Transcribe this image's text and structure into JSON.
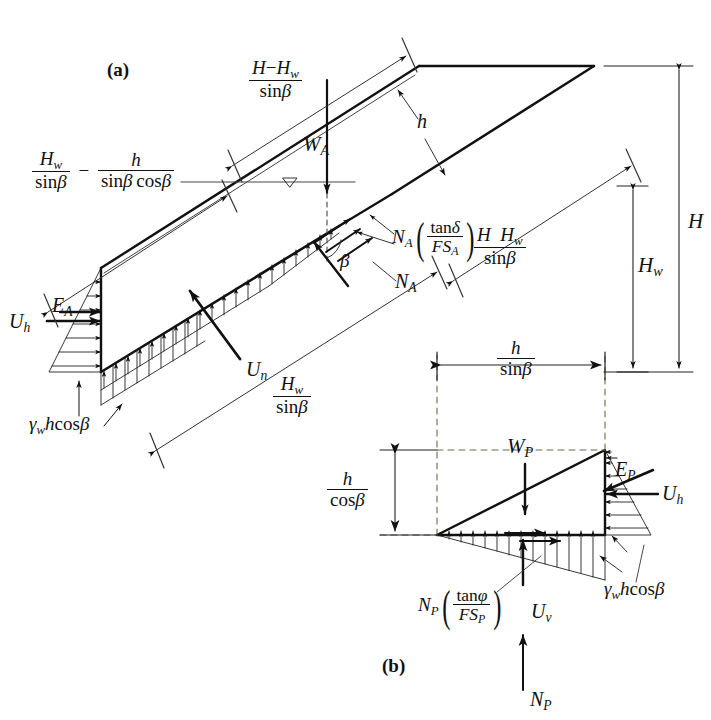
{
  "figure": {
    "title_tags": {
      "a": "(a)",
      "b": "(b)"
    },
    "panel_a": {
      "name": "active-wedge-diagram",
      "dimension_labels": [
        {
          "id": "H-minus-Hw-over-sinbeta",
          "num_parts": [
            "H",
            "−",
            "H",
            "w"
          ],
          "den_parts": [
            "sin",
            "β"
          ]
        },
        {
          "id": "Hw-over-sinbeta-minus-h-over-sinbeta-cosbeta"
        },
        {
          "id": "H-minus-Hw-over-sinbeta-right"
        },
        {
          "id": "Hw-over-sinbeta-bottom"
        },
        {
          "id": "H-total"
        },
        {
          "id": "Hw-total"
        }
      ],
      "force_labels": {
        "W_A": "W",
        "W_A_sub": "A",
        "N_A": "N",
        "N_A_sub": "A",
        "U_n": "U",
        "U_n_sub": "n",
        "U_h": "U",
        "U_h_sub": "h",
        "E_A": "E",
        "E_A_sub": "A",
        "h": "h",
        "beta": "β",
        "gamma_w_h_cos_beta": "γwhcosβ",
        "N_A_tan_delta_over_FS_A": "N_A(tanδ/FS_A)"
      },
      "text": {
        "H": "H",
        "Hw": "Hw",
        "h": "h",
        "beta": "β",
        "delta": "δ",
        "sin": "sin",
        "cos": "cos",
        "tan": "tan",
        "FS": "FS",
        "minus": "−",
        "gamma": "γ"
      }
    },
    "panel_b": {
      "name": "passive-wedge-diagram",
      "dimension_labels": [
        {
          "id": "h-over-sinbeta"
        },
        {
          "id": "h-over-cosbeta"
        }
      ],
      "force_labels": {
        "W_P": "W",
        "W_P_sub": "P",
        "N_P": "N",
        "N_P_sub": "P",
        "U_v": "U",
        "U_v_sub": "v",
        "U_h": "U",
        "U_h_sub": "h",
        "E_P": "E",
        "E_P_sub": "P",
        "gamma_w_h_cos_beta": "γwhcosβ",
        "N_P_tan_phi_over_FS_P": "N_P(tanϕ/FS_P)"
      },
      "text": {
        "phi": "ϕ"
      }
    },
    "colors": {
      "ink": "#111111",
      "background": "#ffffff",
      "thin_line": "#333333"
    }
  }
}
